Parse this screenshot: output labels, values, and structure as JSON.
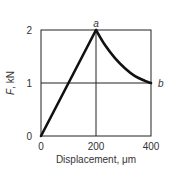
{
  "chart_data": {
    "type": "line",
    "title": "",
    "xlabel": "Displacement, μm",
    "ylabel_italic": "F",
    "ylabel_rest": ", kN",
    "ylabel": "F, kN",
    "xlim": [
      0,
      400
    ],
    "ylim": [
      0,
      2
    ],
    "xticks": [
      0,
      200,
      400
    ],
    "yticks": [
      0,
      1,
      2
    ],
    "xtick_labels": [
      "0",
      "200",
      "400"
    ],
    "ytick_labels": [
      "0",
      "1",
      "2"
    ],
    "grid": {
      "vertical": [
        200
      ],
      "horizontal": [
        1
      ]
    },
    "legend": null,
    "annotations": [
      {
        "label": "a",
        "x": 200,
        "y": 2
      },
      {
        "label": "b",
        "x": 400,
        "y": 1
      }
    ],
    "series": [
      {
        "name": "loading",
        "x": [
          0,
          200
        ],
        "y": [
          0,
          2
        ]
      },
      {
        "name": "unloading",
        "x": [
          200,
          232,
          269,
          305,
          342,
          378,
          400
        ],
        "y": [
          2.0,
          1.72,
          1.47,
          1.28,
          1.13,
          1.04,
          1.0
        ]
      }
    ],
    "line_color": "#111111"
  }
}
